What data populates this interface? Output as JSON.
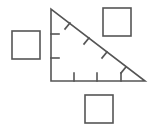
{
  "diagram": {
    "stroke_color": "#555555",
    "background": "#ffffff",
    "triangle": {
      "vertices": [
        [
          51,
          9
        ],
        [
          51,
          81
        ],
        [
          145,
          81
        ]
      ],
      "leg_vertical_ticks": 2,
      "leg_horizontal_ticks": 3,
      "hypotenuse_ticks": 4
    },
    "squares": [
      {
        "name": "left",
        "x": 12,
        "y": 31,
        "size": 28
      },
      {
        "name": "top-right",
        "x": 103,
        "y": 8,
        "size": 28
      },
      {
        "name": "bottom",
        "x": 85,
        "y": 95,
        "size": 28
      }
    ]
  }
}
